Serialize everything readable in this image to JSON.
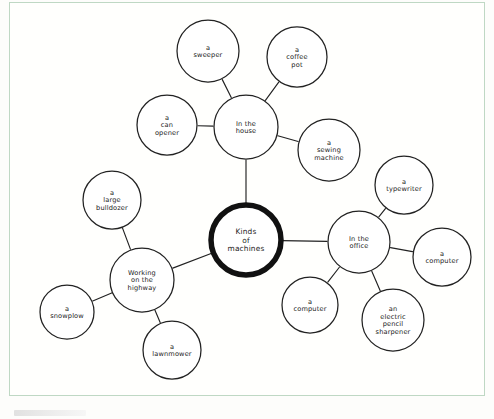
{
  "document": {
    "type": "hand-drawn-mind-map",
    "frame_color": "#bfd8c4",
    "ink_color": "#222222",
    "paper_color": "#fffffd"
  },
  "chart_data": {
    "type": "diagram",
    "layout": "radial mind map / web organizer",
    "center": {
      "id": "center",
      "label": "Kinds of machines",
      "lines": [
        "Kinds",
        "of",
        "machines"
      ],
      "cx": 246,
      "cy": 240,
      "r": 35,
      "emphasis": "thick-outline"
    },
    "branches": [
      {
        "id": "house",
        "label": "In the house",
        "lines": [
          "In the",
          "house"
        ],
        "cx": 246,
        "cy": 127,
        "r": 32,
        "children": [
          {
            "id": "sweeper",
            "label": "a sweeper",
            "lines": [
              "a",
              "sweeper"
            ],
            "cx": 208,
            "cy": 51,
            "r": 31
          },
          {
            "id": "coffee-pot",
            "label": "a coffee pot",
            "lines": [
              "a",
              "coffee",
              "pot"
            ],
            "cx": 297,
            "cy": 57,
            "r": 30
          },
          {
            "id": "can-opener",
            "label": "a can opener",
            "lines": [
              "a",
              "can",
              "opener"
            ],
            "cx": 167,
            "cy": 125,
            "r": 30
          },
          {
            "id": "sewing-machine",
            "label": "a sewing machine",
            "lines": [
              "a",
              "sewing",
              "machine"
            ],
            "cx": 329,
            "cy": 150,
            "r": 31
          }
        ]
      },
      {
        "id": "highway",
        "label": "Working on the highway",
        "lines": [
          "Working",
          "on the",
          "highway"
        ],
        "cx": 142,
        "cy": 280,
        "r": 32,
        "children": [
          {
            "id": "large-bulldozer",
            "label": "a large bulldozer",
            "lines": [
              "a",
              "large",
              "bulldozer"
            ],
            "cx": 112,
            "cy": 200,
            "r": 29
          },
          {
            "id": "snowplow",
            "label": "a snowplow",
            "lines": [
              "a",
              "snowplow"
            ],
            "cx": 67,
            "cy": 312,
            "r": 27
          },
          {
            "id": "lawnmower",
            "label": "a lawnmower",
            "lines": [
              "a",
              "lawnmower"
            ],
            "cx": 172,
            "cy": 350,
            "r": 29
          }
        ]
      },
      {
        "id": "office",
        "label": "In the office",
        "lines": [
          "In the",
          "office"
        ],
        "cx": 359,
        "cy": 242,
        "r": 31,
        "children": [
          {
            "id": "typewriter",
            "label": "a typewriter",
            "lines": [
              "a",
              "typewriter"
            ],
            "cx": 404,
            "cy": 185,
            "r": 29
          },
          {
            "id": "computer-office",
            "label": "a computer",
            "lines": [
              "a",
              "computer"
            ],
            "cx": 442,
            "cy": 257,
            "r": 29
          },
          {
            "id": "computer-lower",
            "label": "a computer",
            "lines": [
              "a",
              "computer"
            ],
            "cx": 310,
            "cy": 305,
            "r": 28
          },
          {
            "id": "pencil-sharpener",
            "label": "an electric pencil sharpener",
            "lines": [
              "an",
              "electric",
              "pencil",
              "sharpener"
            ],
            "cx": 393,
            "cy": 320,
            "r": 31
          }
        ]
      }
    ],
    "edges": [
      [
        "center",
        "house"
      ],
      [
        "center",
        "highway"
      ],
      [
        "center",
        "office"
      ],
      [
        "house",
        "sweeper"
      ],
      [
        "house",
        "coffee-pot"
      ],
      [
        "house",
        "can-opener"
      ],
      [
        "house",
        "sewing-machine"
      ],
      [
        "highway",
        "large-bulldozer"
      ],
      [
        "highway",
        "snowplow"
      ],
      [
        "highway",
        "lawnmower"
      ],
      [
        "office",
        "typewriter"
      ],
      [
        "office",
        "computer-office"
      ],
      [
        "office",
        "computer-lower"
      ],
      [
        "office",
        "pencil-sharpener"
      ]
    ]
  }
}
